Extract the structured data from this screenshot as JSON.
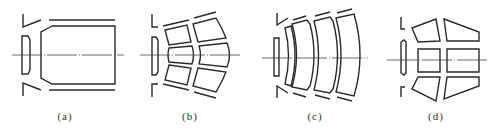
{
  "figure": {
    "panels": [
      {
        "id": "a",
        "label": "(a)",
        "description": "single open chamber with tapered front and end wall"
      },
      {
        "id": "b",
        "label": "(b)",
        "description": "3x2 grid of curved cells"
      },
      {
        "id": "c",
        "label": "(c)",
        "description": "four concentric arc cells"
      },
      {
        "id": "d",
        "label": "(d)",
        "description": "3x2 grid of straight trapezoidal cells"
      }
    ],
    "colors": {
      "line": "#2a2a2a",
      "axis": "#444444",
      "background": "#ffffff"
    }
  }
}
